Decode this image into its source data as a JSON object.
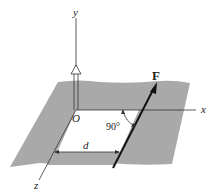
{
  "diagram": {
    "labels": {
      "y_axis": "y",
      "x_axis": "x",
      "z_axis": "z",
      "origin": "O",
      "force": "F",
      "distance": "d",
      "angle": "90°"
    },
    "colors": {
      "plane": "#a9a9a9",
      "line": "#222222",
      "background": "#ffffff"
    }
  }
}
